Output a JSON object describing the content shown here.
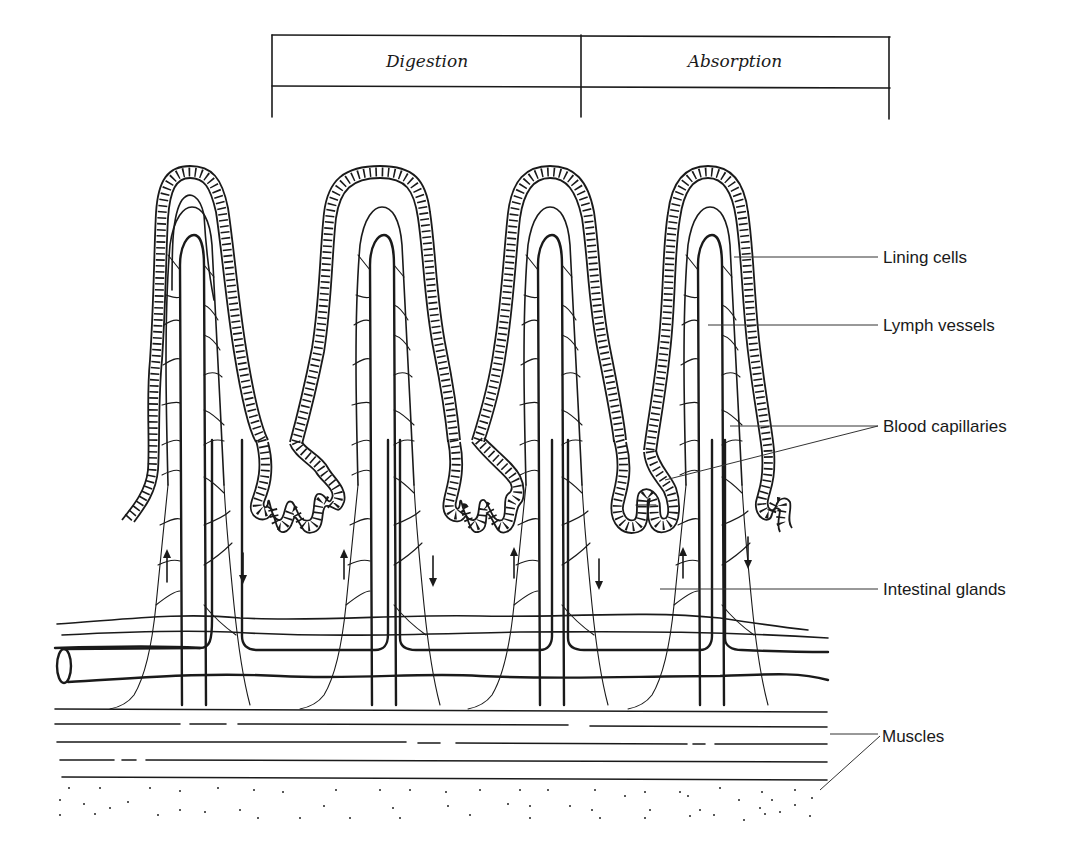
{
  "diagram": {
    "type": "anatomical-cross-section",
    "phase_table": {
      "columns": [
        {
          "label": "Digestion"
        },
        {
          "label": "Absorption"
        }
      ]
    },
    "villi_count": 4,
    "labels": [
      {
        "id": "lining-cells",
        "text": "Lining cells"
      },
      {
        "id": "lymph-vessels",
        "text": "Lymph vessels"
      },
      {
        "id": "blood-capillaries",
        "text": "Blood capillaries"
      },
      {
        "id": "intestinal-glands",
        "text": "Intestinal glands"
      },
      {
        "id": "muscles",
        "text": "Muscles"
      }
    ],
    "flow_arrows": [
      {
        "direction": "up"
      },
      {
        "direction": "down"
      },
      {
        "direction": "up"
      },
      {
        "direction": "down"
      },
      {
        "direction": "up"
      },
      {
        "direction": "down"
      },
      {
        "direction": "up"
      },
      {
        "direction": "down"
      }
    ],
    "colors": {
      "ink": "#1a1a1a",
      "background": "#ffffff"
    }
  }
}
